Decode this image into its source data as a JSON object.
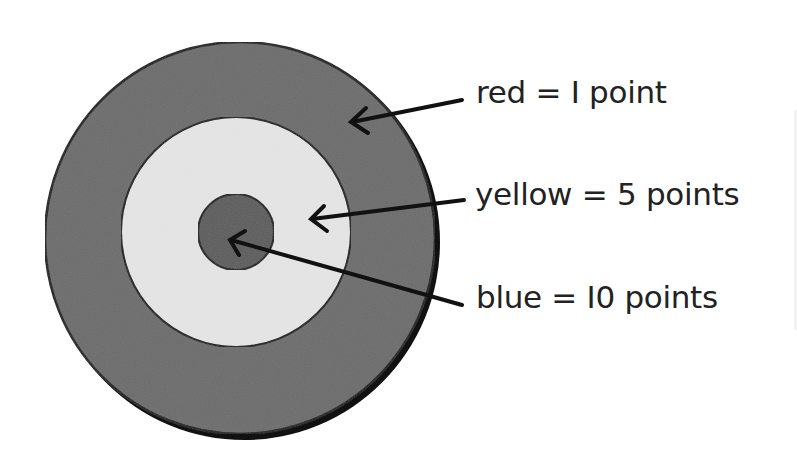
{
  "diagram": {
    "type": "target-scoring",
    "rings": [
      {
        "name": "red",
        "points": 1,
        "fill": "#6b6b6b",
        "radius": 195
      },
      {
        "name": "yellow",
        "points": 5,
        "fill": "#e4e4e4",
        "radius": 115
      },
      {
        "name": "blue",
        "points": 10,
        "fill": "#5c5c5c",
        "radius": 37
      }
    ],
    "labels": {
      "red": "red = I point",
      "yellow": "yellow = 5 points",
      "blue": "blue = I0 points"
    },
    "colors": {
      "outline": "#111111",
      "text": "#222222",
      "background": "#ffffff"
    }
  }
}
